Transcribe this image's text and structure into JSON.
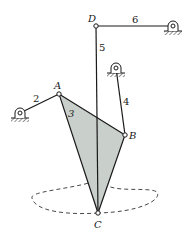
{
  "diagram": {
    "type": "linkage-mechanism",
    "joints": {
      "A": {
        "label": "A"
      },
      "B": {
        "label": "B"
      },
      "C": {
        "label": "C"
      },
      "D": {
        "label": "D"
      }
    },
    "links": {
      "l2": {
        "label": "2"
      },
      "l3": {
        "label": "3"
      },
      "l4": {
        "label": "4"
      },
      "l5": {
        "label": "5"
      },
      "l6": {
        "label": "6"
      }
    },
    "colors": {
      "link_fill": "#c9cfcb",
      "line": "#1a1a1a",
      "ground_hatch": "#555555"
    }
  }
}
